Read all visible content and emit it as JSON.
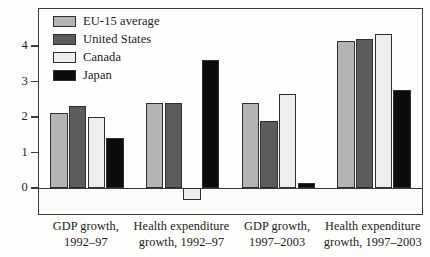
{
  "chart_data": {
    "type": "bar",
    "title": "",
    "subtitle": "",
    "xlabel": "",
    "ylabel": "",
    "ylim": [
      -0.75,
      4.5
    ],
    "yticks": [
      0,
      1,
      2,
      3,
      4
    ],
    "ytick_labels": [
      "0",
      "1",
      "2",
      "3",
      "4"
    ],
    "grid": false,
    "legend_position": "top-left-inside",
    "categories": [
      "GDP growth, 1992–97",
      "Health expenditure growth, 1992–97",
      "GDP growth, 1997–2003",
      "Health expenditure growth, 1997–2003"
    ],
    "category_lines": [
      [
        "GDP growth,",
        "1992–97"
      ],
      [
        "Health expenditure",
        "growth, 1992–97"
      ],
      [
        "GDP growth,",
        "1997–2003"
      ],
      [
        "Health expenditure",
        "growth, 1997–2003"
      ]
    ],
    "series": [
      {
        "name": "EU-15 average",
        "key": "eu",
        "color": "#b4b4b4",
        "values": [
          2.1,
          2.4,
          2.4,
          4.15
        ]
      },
      {
        "name": "United States",
        "key": "us",
        "color": "#5c5c5c",
        "values": [
          2.3,
          2.4,
          1.9,
          4.2
        ]
      },
      {
        "name": "Canada",
        "key": "canada",
        "color": "#eeeeec",
        "values": [
          2.0,
          -0.35,
          2.65,
          4.35
        ]
      },
      {
        "name": "Japan",
        "key": "japan",
        "color": "#0c0c0c",
        "values": [
          1.4,
          3.6,
          0.15,
          2.75
        ]
      }
    ]
  },
  "legend": {
    "items": [
      {
        "label": "EU-15 average",
        "key": "eu"
      },
      {
        "label": "United States",
        "key": "us"
      },
      {
        "label": "Canada",
        "key": "canada"
      },
      {
        "label": "Japan",
        "key": "japan"
      }
    ]
  },
  "axis": {
    "y_tick_labels": [
      "4",
      "3",
      "2",
      "1",
      "0"
    ]
  },
  "colors": {
    "eu": "#b4b4b4",
    "us": "#5c5c5c",
    "canada": "#eeeeec",
    "japan": "#0c0c0c",
    "frame": "#3a3a3a",
    "background": "#fdfdfc"
  }
}
